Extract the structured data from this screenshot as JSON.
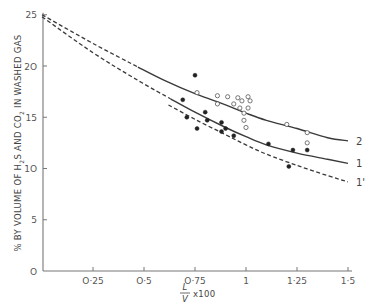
{
  "chart_data": {
    "type": "scatter",
    "title": "",
    "xlabel": "L/V x 100",
    "xlabel_parts": {
      "numerator": "L",
      "denominator": "V",
      "suffix": "x100"
    },
    "ylabel": "% BY VOLUME OF H2S AND CO2 IN WASHED GAS",
    "ylabel_parts": {
      "p1": "% BY VOLUME OF H",
      "s1": "2",
      "p2": "S AND CO",
      "s2": "2",
      "p3": " IN WASHED GAS"
    },
    "xlim": [
      0,
      1.5
    ],
    "ylim": [
      0,
      25
    ],
    "grid": false,
    "x_ticks": [
      {
        "value": 0.25,
        "label": "O·25"
      },
      {
        "value": 0.5,
        "label": "O·5"
      },
      {
        "value": 0.75,
        "label": "O·75"
      },
      {
        "value": 1.0,
        "label": "1"
      },
      {
        "value": 1.25,
        "label": "1·25"
      },
      {
        "value": 1.5,
        "label": "1·5"
      }
    ],
    "y_ticks": [
      {
        "value": 0,
        "label": "O"
      },
      {
        "value": 5,
        "label": "5"
      },
      {
        "value": 10,
        "label": "1O"
      },
      {
        "value": 15,
        "label": "15"
      },
      {
        "value": 20,
        "label": "2O"
      },
      {
        "value": 25,
        "label": "25"
      }
    ],
    "series": [
      {
        "name": "2",
        "kind": "curve",
        "style": "solid (dashed extrapolation below x≈0.53)",
        "x": [
          0.0,
          0.25,
          0.47,
          0.6,
          0.75,
          0.9,
          1.0,
          1.1,
          1.25,
          1.4,
          1.5
        ],
        "y": [
          25.0,
          22.2,
          19.9,
          18.6,
          17.3,
          16.2,
          15.4,
          14.7,
          13.9,
          13.0,
          12.7
        ]
      },
      {
        "name": "1",
        "kind": "curve",
        "style": "solid (dashed extrapolation below x≈0.63)",
        "x": [
          0.0,
          0.25,
          0.47,
          0.63,
          0.75,
          0.9,
          1.0,
          1.1,
          1.25,
          1.4,
          1.5
        ],
        "y": [
          24.8,
          21.3,
          18.6,
          16.8,
          15.5,
          14.0,
          13.1,
          12.3,
          11.5,
          10.9,
          10.5
        ]
      },
      {
        "name": "1'",
        "kind": "curve",
        "style": "dashed",
        "x": [
          0.62,
          0.75,
          0.9,
          1.0,
          1.1,
          1.25,
          1.4,
          1.5
        ],
        "y": [
          16.2,
          14.8,
          13.3,
          12.3,
          11.4,
          10.3,
          9.3,
          8.7
        ]
      },
      {
        "name": "filled points",
        "kind": "points",
        "marker": "filled-circle",
        "points": [
          [
            0.75,
            19.1
          ],
          [
            0.69,
            16.7
          ],
          [
            0.8,
            15.5
          ],
          [
            0.71,
            15.0
          ],
          [
            0.81,
            14.7
          ],
          [
            0.88,
            14.5
          ],
          [
            0.9,
            13.9
          ],
          [
            0.88,
            13.6
          ],
          [
            0.76,
            13.9
          ],
          [
            0.94,
            13.2
          ],
          [
            1.11,
            12.4
          ],
          [
            1.23,
            11.8
          ],
          [
            1.3,
            11.8
          ],
          [
            1.21,
            10.2
          ]
        ]
      },
      {
        "name": "open points",
        "kind": "points",
        "marker": "open-circle",
        "points": [
          [
            0.76,
            17.4
          ],
          [
            0.86,
            16.3
          ],
          [
            0.86,
            17.1
          ],
          [
            0.91,
            17.0
          ],
          [
            0.94,
            16.3
          ],
          [
            0.96,
            16.9
          ],
          [
            0.97,
            15.9
          ],
          [
            0.98,
            16.6
          ],
          [
            1.01,
            17.0
          ],
          [
            0.99,
            15.4
          ],
          [
            0.99,
            14.7
          ],
          [
            1.01,
            15.9
          ],
          [
            1.02,
            16.6
          ],
          [
            1.0,
            14.0
          ],
          [
            1.2,
            14.3
          ],
          [
            1.3,
            13.5
          ],
          [
            1.3,
            12.5
          ]
        ]
      }
    ],
    "curve_labels": [
      {
        "text": "2",
        "x": 1.5,
        "y": 12.7
      },
      {
        "text": "1",
        "x": 1.5,
        "y": 10.5
      },
      {
        "text": "1'",
        "x": 1.5,
        "y": 8.7
      }
    ]
  }
}
